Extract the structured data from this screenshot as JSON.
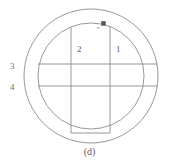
{
  "figure": {
    "caption": "(d)",
    "stroke_color": "#8c8c8c",
    "background_color": "#ffffff",
    "marker_fill": "#5a5a5a"
  },
  "labels": {
    "region_1": "1",
    "region_2": "2",
    "region_3": "3",
    "region_4": "4",
    "marker": "a"
  },
  "icons": {
    "marker": "filled-square-marker"
  }
}
